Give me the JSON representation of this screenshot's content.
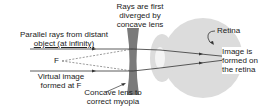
{
  "diagram": {
    "labels": {
      "rays_diverged": [
        "Rays are first",
        "diverged by",
        "concave lens"
      ],
      "parallel_rays": [
        "Parallel rays from distant",
        "object (at infinity)"
      ],
      "focal_point": "F",
      "virtual_image": [
        "Virtual image",
        "formed at F"
      ],
      "concave_lens": [
        "Concave lens to",
        "correct myopia"
      ],
      "retina": "Retina",
      "image_formed": [
        "Image is",
        "formed on",
        "the retina"
      ]
    },
    "colors": {
      "lens": "#7a7a7a",
      "eye": "#dcdcdc",
      "ray": "#333333",
      "text": "#222222"
    }
  }
}
